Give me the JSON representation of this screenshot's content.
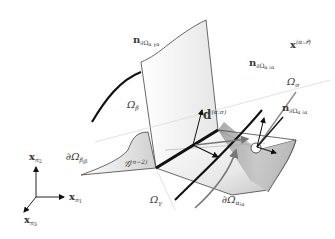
{
  "diagram": {
    "type": "3d-geometry-schematic",
    "background": "#ffffff",
    "colors": {
      "surface_light": "#f4f4f4",
      "surface_mid": "#d8d8d8",
      "surface_dark": "#a8a8a8",
      "line": "#3a3a3a",
      "thick_curve": "#111111",
      "gray_arrow": "#888888"
    },
    "labels": {
      "n_top": {
        "main": "n",
        "sub": "∂Ω",
        "subsub": "α γα"
      },
      "omega_beta": {
        "main": "Ω",
        "sub": "β"
      },
      "x_alpha": {
        "main": "x",
        "sup": "(α:𝒫)"
      },
      "n_right_upper": {
        "main": "n",
        "sub": "∂Ω",
        "subsub": "α iα"
      },
      "omega_sigma": {
        "main": "Ω",
        "sub": "σ"
      },
      "n_right_lower": {
        "main": "n",
        "sub": "∂Ω",
        "subsub": "α iα"
      },
      "d_vector": {
        "main": "d",
        "sup": "(α:σ)"
      },
      "boundary_beta": {
        "main": "∂Ω",
        "sub": "β",
        "subsub": "jβ"
      },
      "g_curve": {
        "main": "𝒢",
        "sup": "(n−2)"
      },
      "omega_gamma": {
        "main": "Ω",
        "sub": "γ"
      },
      "boundary_alpha": {
        "main": "∂Ω",
        "sub": "α",
        "subsub": "iα"
      }
    },
    "axes": {
      "x2": {
        "main": "x",
        "sub": "n",
        "subsub": "2"
      },
      "x1": {
        "main": "x",
        "sub": "n",
        "subsub": "1"
      },
      "x3": {
        "main": "x",
        "sub": "n",
        "subsub": "3"
      }
    }
  }
}
